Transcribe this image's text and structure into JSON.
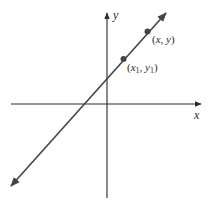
{
  "diagram": {
    "type": "coordinate-plane-line",
    "axes": {
      "x_label": "x",
      "y_label": "y",
      "color": "#2a2a2a"
    },
    "line": {
      "color": "#444444",
      "description": "line with positive slope through two points"
    },
    "points": [
      {
        "label_open": "(",
        "var_x": "x",
        "sub_x": "1",
        "comma": ", ",
        "var_y": "y",
        "sub_y": "1",
        "label_close": ")",
        "name": "point-x1-y1"
      },
      {
        "label_open": "(",
        "var_x": "x",
        "sub_x": "",
        "comma": ", ",
        "var_y": "y",
        "sub_y": "",
        "label_close": ")",
        "name": "point-x-y"
      }
    ],
    "point_color": "#444444"
  }
}
